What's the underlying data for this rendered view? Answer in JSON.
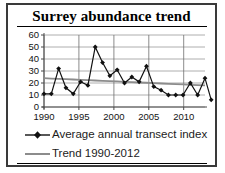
{
  "chart_data": {
    "type": "line",
    "title": "Surrey abundance trend",
    "xlabel": "",
    "ylabel": "",
    "xlim": [
      1989.4,
      2012.6
    ],
    "ylim": [
      0,
      60
    ],
    "ytick_values": [
      0,
      10,
      20,
      30,
      40,
      50,
      60
    ],
    "ytick_labels": [
      "0",
      "10",
      "20",
      "30",
      "40",
      "50",
      "60"
    ],
    "xtick_values": [
      1990,
      1995,
      2000,
      2005,
      2010
    ],
    "xtick_labels": [
      "1990",
      "1995",
      "2000",
      "2005",
      "2010"
    ],
    "grid": "horizontal",
    "legend_position": "bottom-left",
    "x": [
      1990,
      1991,
      1992,
      1993,
      1994,
      1995,
      1996,
      1997,
      1998,
      1999,
      2000,
      2001,
      2002,
      2003,
      2004,
      2005,
      2006,
      2007,
      2008,
      2009,
      2010,
      2011,
      2012
    ],
    "series": [
      {
        "name": "Average annual transect index",
        "type": "line-markers",
        "color": "#111111",
        "marker": "diamond",
        "values": [
          11,
          11,
          32,
          16,
          11,
          21,
          18,
          50,
          37,
          26,
          31,
          20,
          25,
          21,
          34,
          17,
          14,
          10,
          10,
          10,
          20,
          10,
          24
        ]
      },
      {
        "name": "Trend 1990-2012",
        "type": "line",
        "color": "#8c8c8c",
        "marker": "none",
        "values": [
          24,
          23.7,
          23.5,
          23.2,
          22.9,
          22.6,
          22.4,
          22.1,
          21.8,
          21.5,
          21.3,
          21.0,
          20.7,
          20.4,
          20.2,
          19.9,
          19.6,
          19.3,
          19.1,
          18.8,
          18.5,
          18.2,
          18.0
        ]
      }
    ],
    "final_point_value": 6
  },
  "legend": {
    "items": [
      {
        "label": "Average annual transect index",
        "key": "line-marker-key"
      },
      {
        "label": "Trend 1990-2012",
        "key": "line-key"
      }
    ]
  }
}
